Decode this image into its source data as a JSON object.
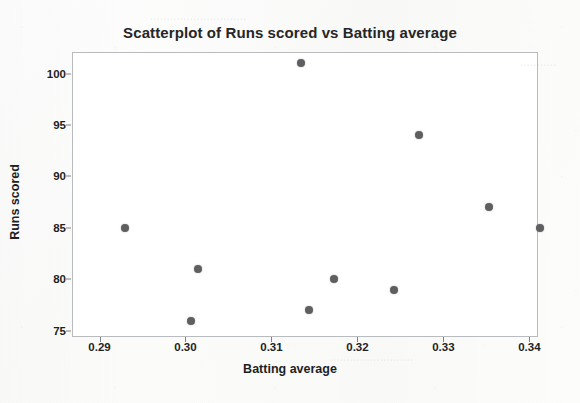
{
  "chart_data": {
    "type": "scatter",
    "title": "Scatterplot of Runs scored vs Batting average",
    "xlabel": "Batting average",
    "ylabel": "Runs scored",
    "xlim": [
      0.2868,
      0.341
    ],
    "ylim": [
      74.4,
      102.1
    ],
    "grid": false,
    "legend": null,
    "xticks": [
      0.29,
      0.3,
      0.31,
      0.32,
      0.33,
      0.34
    ],
    "xtick_labels": [
      "0.29",
      "0.30",
      "0.31",
      "0.32",
      "0.33",
      "0.34"
    ],
    "yticks": [
      75,
      80,
      85,
      90,
      95,
      100
    ],
    "ytick_labels": [
      "75",
      "80",
      "85",
      "90",
      "95",
      "100"
    ],
    "marker_color": "#5f5f61",
    "marker_size": 8,
    "points": [
      {
        "x": 0.293,
        "y": 85
      },
      {
        "x": 0.3006,
        "y": 76
      },
      {
        "x": 0.3015,
        "y": 81
      },
      {
        "x": 0.3134,
        "y": 101
      },
      {
        "x": 0.3144,
        "y": 77
      },
      {
        "x": 0.3173,
        "y": 80
      },
      {
        "x": 0.3242,
        "y": 79
      },
      {
        "x": 0.3272,
        "y": 94
      },
      {
        "x": 0.3353,
        "y": 87
      },
      {
        "x": 0.3412,
        "y": 85
      }
    ],
    "series": [
      {
        "name": "Runs scored",
        "x": [
          0.293,
          0.3006,
          0.3015,
          0.3134,
          0.3144,
          0.3173,
          0.3242,
          0.3272,
          0.3353,
          0.3412
        ],
        "values": [
          85,
          76,
          81,
          101,
          77,
          80,
          79,
          94,
          87,
          85
        ]
      }
    ]
  },
  "figure": {
    "background_color": "#fcfcfb",
    "plot_background_color": "#ffffff",
    "plot_border_color": "#b9bcbe",
    "axis_text_color": "#1f1f1f",
    "title_color": "#262626"
  }
}
